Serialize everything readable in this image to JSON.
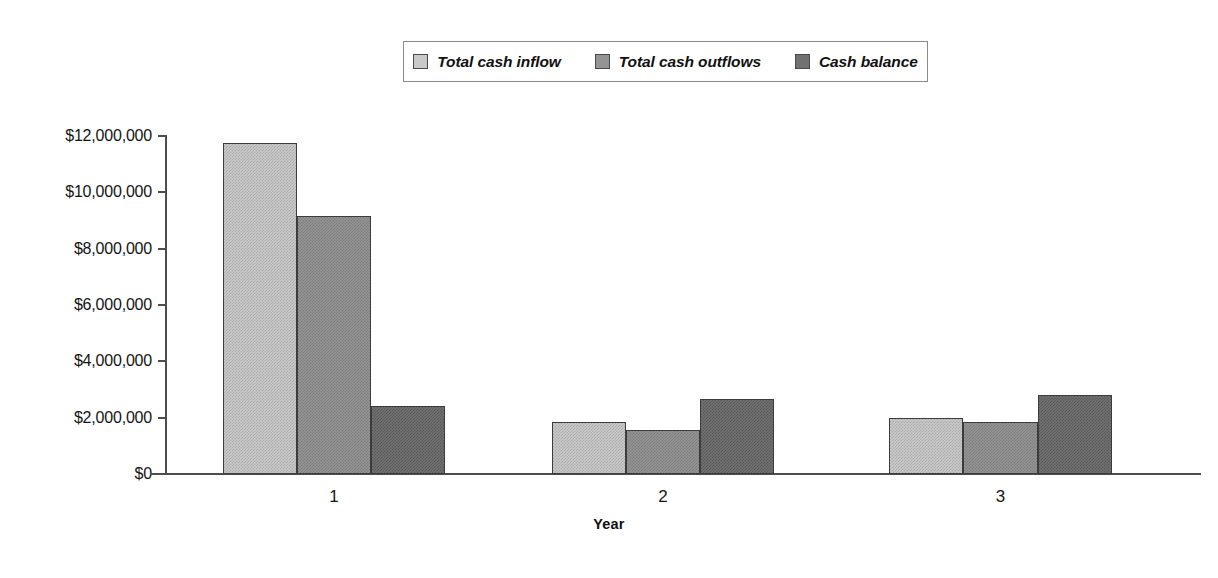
{
  "chart_data": {
    "type": "bar",
    "title": "",
    "xlabel": "Year",
    "ylabel": "",
    "categories": [
      "1",
      "2",
      "3"
    ],
    "ylim": [
      0,
      12000000
    ],
    "ytick_labels": [
      "$12,000,000",
      "$10,000,000",
      "$8,000,000",
      "$6,000,000",
      "$4,000,000",
      "$2,000,000",
      "$0"
    ],
    "ytick_values": [
      12000000,
      10000000,
      8000000,
      6000000,
      4000000,
      2000000,
      0
    ],
    "grid": false,
    "legend_position": "top-center",
    "series": [
      {
        "name": "Total cash inflow",
        "color": "#c9c9c9",
        "values": [
          11750000,
          1850000,
          2000000
        ]
      },
      {
        "name": "Total cash outflows",
        "color": "#949494",
        "values": [
          9150000,
          1550000,
          1850000
        ]
      },
      {
        "name": "Cash balance",
        "color": "#717171",
        "values": [
          2420000,
          2650000,
          2800000
        ]
      }
    ]
  },
  "legend": {
    "entries": [
      {
        "label": "Total cash inflow",
        "swatch": "legend-swatch-total-cash-inflow"
      },
      {
        "label": "Total cash outflows",
        "swatch": "legend-swatch-total-cash-outflows"
      },
      {
        "label": "Cash balance",
        "swatch": "legend-swatch-cash-balance"
      }
    ]
  },
  "axes": {
    "x_title": "Year",
    "x_labels": [
      "1",
      "2",
      "3"
    ],
    "y_labels": [
      "$12,000,000",
      "$10,000,000",
      "$8,000,000",
      "$6,000,000",
      "$4,000,000",
      "$2,000,000",
      "$0"
    ]
  }
}
